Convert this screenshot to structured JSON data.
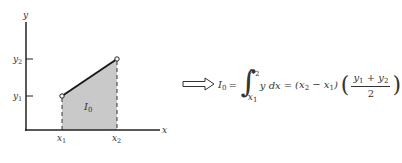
{
  "diagram": {
    "axes": {
      "x_label": "x",
      "y_label": "y",
      "x_ticks": [
        {
          "label": "x",
          "sub": "1"
        },
        {
          "label": "x",
          "sub": "2"
        }
      ],
      "y_ticks": [
        {
          "label": "y",
          "sub": "1"
        },
        {
          "label": "y",
          "sub": "2"
        }
      ]
    },
    "region_label": {
      "label": "I",
      "sub": "0"
    },
    "points": [
      {
        "name": "(x1, y1)"
      },
      {
        "name": "(x2, y2)"
      }
    ],
    "colors": {
      "fill": "#c9c9c9",
      "line": "#1a1a1a"
    }
  },
  "formula": {
    "lhs": "I",
    "lhs_sub": "0",
    "equals": "=",
    "int_upper": "x",
    "int_upper_sub": "2",
    "int_lower": "x",
    "int_lower_sub": "1",
    "integrand": "y dx",
    "equals2": "=",
    "diff_open": "(x",
    "diff_sub_a": "2",
    "diff_mid": " − x",
    "diff_sub_b": "1",
    "diff_close": ")",
    "num_a": "y",
    "num_a_sub": "1",
    "num_plus": " + y",
    "num_b_sub": "2",
    "den": "2",
    "paren_open": "(",
    "paren_close": ")"
  }
}
